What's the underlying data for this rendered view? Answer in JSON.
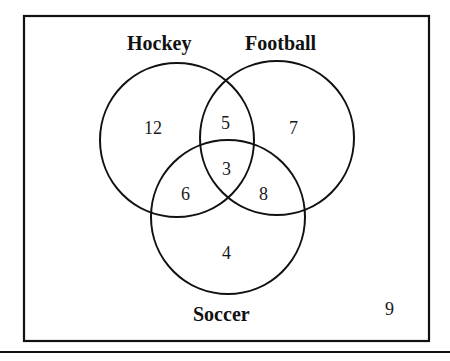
{
  "diagram": {
    "type": "venn-3",
    "colors": {
      "stroke": "#111111",
      "background": "#ffffff",
      "text": "#111111"
    },
    "universe": {
      "outside_count": "9"
    },
    "sets": [
      {
        "id": "hockey",
        "label": "Hockey"
      },
      {
        "id": "football",
        "label": "Football"
      },
      {
        "id": "soccer",
        "label": "Soccer"
      }
    ],
    "regions": {
      "hockey_only": "12",
      "football_only": "7",
      "soccer_only": "4",
      "hockey_football_only": "5",
      "hockey_soccer_only": "6",
      "football_soccer_only": "8",
      "all_three": "3"
    }
  }
}
